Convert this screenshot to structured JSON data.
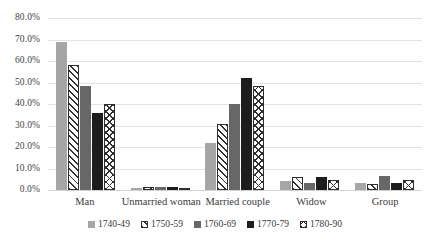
{
  "chart_data": {
    "type": "bar",
    "title": "",
    "subtitle": "",
    "xlabel": "",
    "ylabel": "",
    "ylim": [
      0,
      80
    ],
    "ytick_labels": [
      "0.0%",
      "10.0%",
      "20.0%",
      "30.0%",
      "40.0%",
      "50.0%",
      "60.0%",
      "70.0%",
      "80.0%"
    ],
    "ytick_values": [
      0,
      10,
      20,
      30,
      40,
      50,
      60,
      70,
      80
    ],
    "grid": true,
    "legend_position": "bottom",
    "categories": [
      "Man",
      "Unmarried woman",
      "Married couple",
      "Widow",
      "Group"
    ],
    "series": [
      {
        "name": "1740-49",
        "pattern": "solid-light-gray",
        "color": "#a6a6a6",
        "values": [
          68.8,
          0.8,
          21.7,
          4.3,
          3.4
        ]
      },
      {
        "name": "1750-59",
        "pattern": "diagonal-hatch",
        "color": "#ffffff",
        "values": [
          58.0,
          1.3,
          30.7,
          6.2,
          2.9
        ]
      },
      {
        "name": "1760-69",
        "pattern": "solid-mid-gray",
        "color": "#676767",
        "values": [
          48.2,
          1.2,
          40.2,
          3.2,
          6.6
        ]
      },
      {
        "name": "1770-79",
        "pattern": "solid-near-black",
        "color": "#1d1d1d",
        "values": [
          35.6,
          1.4,
          52.1,
          6.1,
          3.3
        ]
      },
      {
        "name": "1780-90",
        "pattern": "cross-hatch",
        "color": "#ffffff",
        "values": [
          39.9,
          0.9,
          48.4,
          4.6,
          4.5
        ]
      }
    ]
  }
}
